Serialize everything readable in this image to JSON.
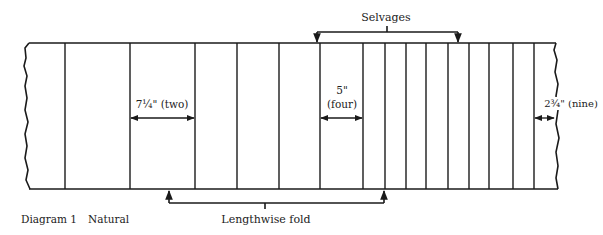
{
  "diagram": {
    "caption": "Diagram 1",
    "subtitle": "Natural",
    "stroke_color": "#1a1a1a",
    "fabric": {
      "top_y": 43,
      "bottom_y": 189,
      "left_x": 25,
      "right_x": 555,
      "fold_lines_x": [
        65,
        130,
        195,
        237,
        279,
        320,
        363,
        385,
        406,
        426,
        448,
        469,
        489,
        513,
        534
      ]
    },
    "labels": {
      "selvages": "Selvages",
      "lengthwise_fold": "Lengthwise fold",
      "dim_two": "7¼\" (two)",
      "dim_four_value": "5\"",
      "dim_four_count": "(four)",
      "dim_nine": "2¾\" (nine)"
    }
  }
}
